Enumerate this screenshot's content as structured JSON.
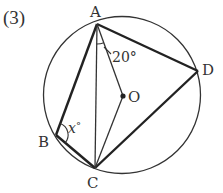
{
  "problem_number": "(3)",
  "points": {
    "A": {
      "label": "A",
      "x": 97,
      "y": 24
    },
    "B": {
      "label": "B",
      "x": 56,
      "y": 135
    },
    "C": {
      "label": "C",
      "x": 95,
      "y": 168
    },
    "D": {
      "label": "D",
      "x": 198,
      "y": 71
    },
    "O": {
      "label": "O",
      "x": 123,
      "y": 96
    }
  },
  "circle": {
    "cx": 122,
    "cy": 95,
    "r": 79
  },
  "angles": {
    "given": "20°",
    "unknown_var": "x",
    "unknown_deg": "°"
  },
  "colors": {
    "stroke": "#333333",
    "background": "#ffffff"
  }
}
